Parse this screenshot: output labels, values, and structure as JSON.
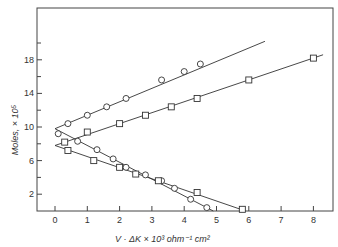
{
  "chart_data": {
    "type": "scatter",
    "title": "",
    "xlabel": "V · ΔK × 10³ ohm⁻¹ cm²",
    "ylabel": "Moles, × 10⁵",
    "xlim": [
      -0.4,
      8.6
    ],
    "ylim": [
      0,
      23.5
    ],
    "x_ticks": [
      0,
      1,
      2,
      3,
      4,
      5,
      6,
      7,
      8
    ],
    "y_ticks_labeled": [
      2,
      6,
      10,
      14,
      18
    ],
    "y_ticks_minor": [
      4,
      8,
      12,
      16,
      20
    ],
    "grid": false,
    "legend": null,
    "series": [
      {
        "name": "circles-rising",
        "marker": "circle",
        "x": [
          0.4,
          1.0,
          1.6,
          2.2,
          3.3,
          4.0,
          4.5
        ],
        "y": [
          10.4,
          11.4,
          12.4,
          13.4,
          15.6,
          16.6,
          17.5
        ],
        "fit_line": [
          [
            0,
            9.8
          ],
          [
            6.5,
            20.2
          ]
        ]
      },
      {
        "name": "squares-rising",
        "marker": "square",
        "x": [
          0.3,
          1.0,
          2.0,
          2.8,
          3.6,
          4.4,
          6.0,
          8.0
        ],
        "y": [
          8.2,
          9.4,
          10.4,
          11.4,
          12.4,
          13.4,
          15.6,
          18.2
        ],
        "fit_line": [
          [
            0,
            7.8
          ],
          [
            8.3,
            18.6
          ]
        ]
      },
      {
        "name": "circles-falling",
        "marker": "circle",
        "x": [
          0.1,
          0.7,
          1.3,
          1.8,
          2.2,
          2.8,
          3.3,
          3.7,
          4.2,
          4.7
        ],
        "y": [
          9.2,
          8.3,
          7.3,
          6.2,
          5.2,
          4.3,
          3.6,
          2.7,
          1.4,
          0.4
        ],
        "fit_line": [
          [
            0,
            9.8
          ],
          [
            4.9,
            0
          ]
        ]
      },
      {
        "name": "squares-falling",
        "marker": "square",
        "x": [
          0.4,
          1.2,
          2.0,
          2.5,
          3.2,
          4.4,
          5.8
        ],
        "y": [
          7.2,
          6.0,
          5.2,
          4.4,
          3.6,
          2.2,
          0.2
        ],
        "fit_line": [
          [
            0,
            7.8
          ],
          [
            5.9,
            0
          ]
        ]
      }
    ]
  }
}
